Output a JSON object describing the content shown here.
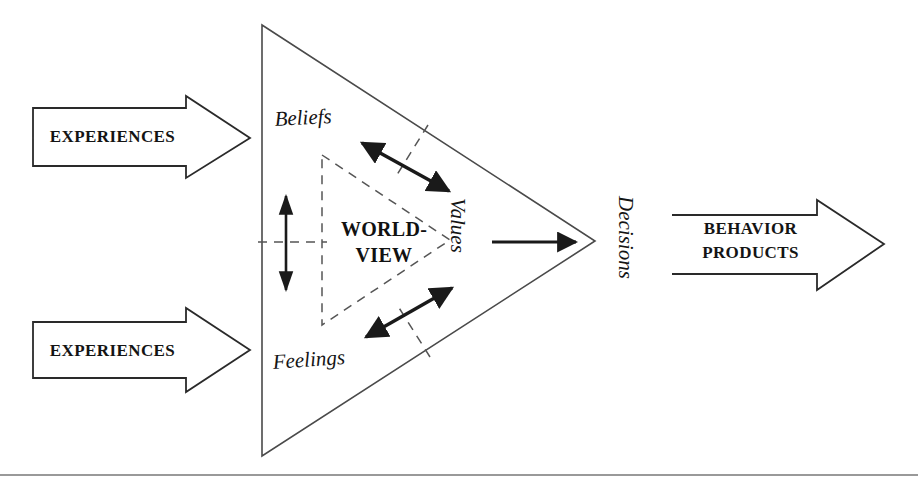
{
  "diagram": {
    "colors": {
      "ink": "#1a1a1a",
      "line": "#4a4a4a",
      "background": "#ffffff",
      "rule": "#777777"
    },
    "input_arrows": [
      {
        "label": "EXPERIENCES",
        "direction": "right"
      },
      {
        "label": "EXPERIENCES",
        "direction": "right"
      }
    ],
    "output_arrow": {
      "line1": "BEHAVIOR",
      "line2": "PRODUCTS",
      "direction": "right"
    },
    "triangle_nodes": [
      {
        "name": "beliefs",
        "label": "Beliefs"
      },
      {
        "name": "feelings",
        "label": "Feelings"
      },
      {
        "name": "values",
        "label": "Values"
      }
    ],
    "center_label": {
      "line1": "WORLD-",
      "line2": "VIEW"
    },
    "output_label": "Decisions",
    "connectors": [
      {
        "name": "beliefs-values",
        "style": "double-headed"
      },
      {
        "name": "feelings-values",
        "style": "double-headed"
      },
      {
        "name": "worldview-vertical",
        "style": "double-headed"
      },
      {
        "name": "values-decisions",
        "style": "single-headed"
      }
    ]
  }
}
